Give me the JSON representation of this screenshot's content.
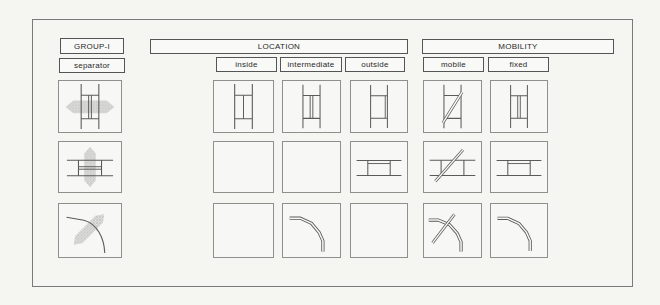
{
  "title_labels": {
    "group": "GROUP-I",
    "row": "separator",
    "location": "LOCATION",
    "mobility": "MOBILITY"
  },
  "columns": {
    "location": [
      "inside",
      "intermediate",
      "outside"
    ],
    "mobility": [
      "mobile",
      "fixed"
    ]
  },
  "grid": {
    "separator": [
      "sep-straight-v",
      "sep-straight-h",
      "sep-curve"
    ],
    "inside": [
      "panel-inside-v",
      "",
      ""
    ],
    "intermediate": [
      "panel-mid-v",
      "",
      "curve-double"
    ],
    "outside": [
      "panel-outside-v",
      "panel-top-h",
      ""
    ],
    "mobile": [
      "panel-diag-v",
      "panel-diag-h",
      "curve-cross"
    ],
    "fixed": [
      "panel-mid-v",
      "panel-top-h",
      "curve-double"
    ]
  },
  "colors": {
    "line": "#5b5b5b",
    "arrow_fill": "#cdcdcb",
    "paper": "#f7f7f5",
    "border": "#8f8f8d"
  }
}
